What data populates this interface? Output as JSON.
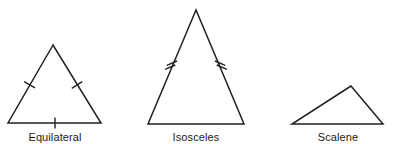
{
  "diagram": {
    "background_color": "#ffffff",
    "stroke_color": "#231f20",
    "label_color": "#1a1a1a",
    "figures": [
      {
        "id": "equilateral",
        "label": "Equilateral",
        "description": "Triangle with three equal sides, marked with single tick marks on all three sides",
        "tick_style": "single",
        "tick_count_per_side": 1,
        "marked_sides": [
          "left",
          "right",
          "base"
        ],
        "vertices": {
          "apex": [
            53,
            45
          ],
          "bottom_left": [
            8,
            123
          ],
          "bottom_right": [
            101,
            123
          ]
        },
        "polygon_points": "53,45 8,123 101,123"
      },
      {
        "id": "isosceles",
        "label": "Isosceles",
        "description": "Triangle with two equal legs, marked with double tick marks on the two slanted sides",
        "tick_style": "double",
        "tick_count_per_side": 2,
        "marked_sides": [
          "left",
          "right"
        ],
        "vertices": {
          "apex": [
            196,
            10
          ],
          "bottom_left": [
            148,
            124
          ],
          "bottom_right": [
            244,
            124
          ]
        },
        "polygon_points": "196,10 148,124 244,124"
      },
      {
        "id": "scalene",
        "label": "Scalene",
        "description": "Triangle with three unequal sides and no tick marks",
        "tick_style": "none",
        "tick_count_per_side": 0,
        "marked_sides": [],
        "vertices": {
          "apex": [
            351,
            86
          ],
          "bottom_left": [
            292,
            124
          ],
          "bottom_right": [
            383,
            124
          ]
        },
        "polygon_points": "351,86 292,124 383,124"
      }
    ]
  }
}
